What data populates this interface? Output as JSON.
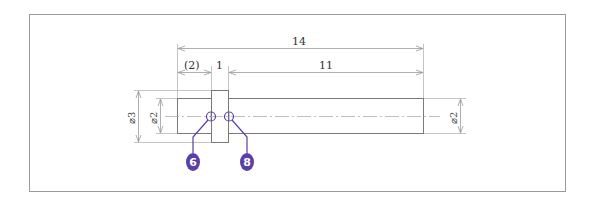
{
  "drawing": {
    "frame": {
      "x": 29,
      "y": 14,
      "width": 536,
      "height": 177,
      "stroke": "#9a9a9a"
    },
    "colors": {
      "line": "#7a7a7a",
      "dim_line": "#9a9a9a",
      "center_line": "#b0b0b0",
      "balloon": "#5b3fa8",
      "leader": "#5b3fa8"
    },
    "dimensions": {
      "overall_length": "14",
      "left_reference": "(2)",
      "collar_width": "1",
      "right_length": "11",
      "collar_diameter": "⌀3",
      "left_diameter": "⌀2",
      "right_diameter": "⌀2"
    },
    "balloons": [
      {
        "label": "6"
      },
      {
        "label": "8"
      }
    ]
  }
}
